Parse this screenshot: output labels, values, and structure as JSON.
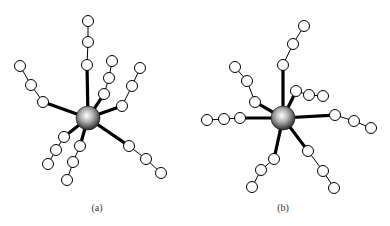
{
  "figure": {
    "panels": [
      {
        "id": "a",
        "label": "(a)",
        "core": {
          "x": 88,
          "y": 118,
          "r": 12
        },
        "arms": [
          [
            [
              87,
              65
            ],
            [
              88,
              42
            ],
            [
              88,
              21
            ]
          ],
          [
            [
              43,
              102
            ],
            [
              31,
              85
            ],
            [
              20,
              66
            ]
          ],
          [
            [
              104,
              94
            ],
            [
              109,
              78
            ],
            [
              112,
              61
            ]
          ],
          [
            [
              122,
              106
            ],
            [
              132,
              86
            ],
            [
              140,
              68
            ]
          ],
          [
            [
              129,
              146
            ],
            [
              146,
              159
            ],
            [
              161,
              173
            ]
          ],
          [
            [
              64,
              137
            ],
            [
              56,
              150
            ],
            [
              48,
              164
            ]
          ],
          [
            [
              80,
              146
            ],
            [
              73,
              162
            ],
            [
              67,
              180
            ]
          ]
        ]
      },
      {
        "id": "b",
        "label": "(b)",
        "core": {
          "x": 283,
          "y": 118,
          "r": 12
        },
        "arms": [
          [
            [
              283,
              65
            ],
            [
              293,
              44
            ],
            [
              304,
              26
            ]
          ],
          [
            [
              255,
              102
            ],
            [
              247,
              81
            ],
            [
              235,
              67
            ]
          ],
          [
            [
              296,
              91
            ],
            [
              309,
              95
            ],
            [
              323,
              96
            ]
          ],
          [
            [
              240,
              118
            ],
            [
              224,
              119
            ],
            [
              207,
              120
            ]
          ],
          [
            [
              335,
              115
            ],
            [
              354,
              121
            ],
            [
              371,
              128
            ]
          ],
          [
            [
              308,
              151
            ],
            [
              323,
              171
            ],
            [
              334,
              188
            ]
          ],
          [
            [
              274,
              159
            ],
            [
              261,
              170
            ],
            [
              252,
              187
            ]
          ]
        ]
      }
    ],
    "bead_radius": 5.5,
    "colors": {
      "bond": "#000000",
      "bead_fill": "#ffffff",
      "core_light": "#ffffff",
      "core_dark": "#333333"
    }
  }
}
